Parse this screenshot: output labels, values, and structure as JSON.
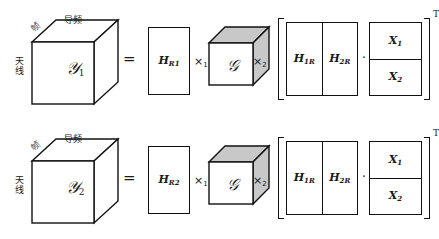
{
  "figure": {
    "caption": "Tucker tensor decomposition of received signal tensors",
    "stroke_color": "#111111",
    "core_shade_color": "#c8c8c8",
    "background_color": "#ffffff"
  },
  "axis_labels": {
    "top": "导频",
    "diagonal": "帧",
    "left": "天线"
  },
  "symbols": {
    "equals": "=",
    "mode1_product": "×",
    "mode1_sub": "1",
    "mode2_product": "×",
    "mode2_sub": "2",
    "dot_product": "·",
    "transpose": "T",
    "core": "𝒢"
  },
  "rows": [
    {
      "id": "equation-1",
      "tensor": {
        "name": "𝒴",
        "sub": "1"
      },
      "h_matrix": {
        "name": "H",
        "sub": "R1"
      },
      "block_h": [
        {
          "name": "H",
          "sub": "1R"
        },
        {
          "name": "H",
          "sub": "2R"
        }
      ],
      "block_x": [
        {
          "name": "X",
          "sub": "1"
        },
        {
          "name": "X",
          "sub": "2"
        }
      ]
    },
    {
      "id": "equation-2",
      "tensor": {
        "name": "𝒴",
        "sub": "2"
      },
      "h_matrix": {
        "name": "H",
        "sub": "R2"
      },
      "block_h": [
        {
          "name": "H",
          "sub": "1R"
        },
        {
          "name": "H",
          "sub": "2R"
        }
      ],
      "block_x": [
        {
          "name": "X",
          "sub": "1"
        },
        {
          "name": "X",
          "sub": "2"
        }
      ]
    }
  ]
}
